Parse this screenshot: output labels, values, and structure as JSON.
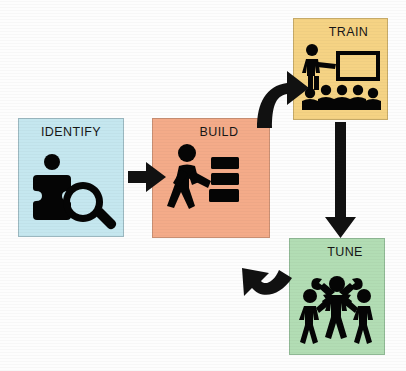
{
  "diagram": {
    "type": "cycle-flow",
    "background": "#fdfdfd",
    "stages": [
      {
        "id": "identify",
        "label": "IDENTIFY",
        "color": "#c5e7ef",
        "border": "#9bb8c0",
        "icon": "puzzle-magnifier-icon",
        "x": 18,
        "y": 118,
        "w": 106,
        "h": 119,
        "label_align": "center"
      },
      {
        "id": "build",
        "label": "BUILD",
        "color": "#f4ab89",
        "border": "#c98f73",
        "icon": "worker-carrying-blocks-icon",
        "x": 152,
        "y": 118,
        "w": 118,
        "h": 120,
        "label_align": "right"
      },
      {
        "id": "train",
        "label": "TRAIN",
        "color": "#f5d384",
        "border": "#c6aa68",
        "icon": "instructor-whiteboard-audience-icon",
        "x": 293,
        "y": 18,
        "w": 95,
        "h": 102,
        "label_align": "right"
      },
      {
        "id": "tune",
        "label": "TUNE",
        "color": "#b2ddb4",
        "border": "#8fb894",
        "icon": "three-figures-wrenches-icon",
        "x": 289,
        "y": 238,
        "w": 96,
        "h": 117,
        "label_align": "right"
      }
    ],
    "connectors": [
      {
        "id": "identify-to-build",
        "from": "identify",
        "to": "build",
        "style": "straight-arrow",
        "direction": "right",
        "color": "#111111"
      },
      {
        "id": "build-to-train",
        "from": "build",
        "to": "train",
        "style": "curved-arrow",
        "direction": "up-right",
        "color": "#111111"
      },
      {
        "id": "train-to-tune",
        "from": "train",
        "to": "tune",
        "style": "straight-arrow",
        "direction": "down",
        "color": "#111111"
      },
      {
        "id": "tune-to-build",
        "from": "tune",
        "to": "build",
        "style": "curved-arrow",
        "direction": "left-up",
        "color": "#111111"
      }
    ]
  }
}
